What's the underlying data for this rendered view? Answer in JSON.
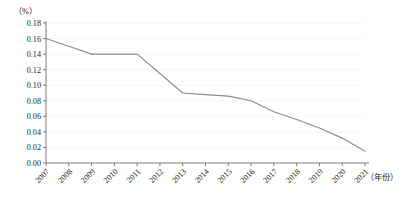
{
  "chart_data": {
    "type": "line",
    "title": "",
    "subtitle": "",
    "xlabel": "（年份）",
    "ylabel": "（%）",
    "ylim": [
      0,
      0.18
    ],
    "ytick_step": 0.02,
    "yticks": [
      "0.00",
      "0.02",
      "0.04",
      "0.06",
      "0.08",
      "0.10",
      "0.12",
      "0.14",
      "0.16",
      "0.18"
    ],
    "ytick_values": [
      0.0,
      0.02,
      0.04,
      0.06,
      0.08,
      0.1,
      0.12,
      0.14,
      0.16,
      0.18
    ],
    "categories": [
      "2007",
      "2008",
      "2009",
      "2010",
      "2011",
      "2012",
      "2013",
      "2014",
      "2015",
      "2016",
      "2017",
      "2018",
      "2019",
      "2020",
      "2021"
    ],
    "x": [
      2007,
      2008,
      2009,
      2010,
      2011,
      2012,
      2013,
      2014,
      2015,
      2016,
      2017,
      2018,
      2019,
      2020,
      2021
    ],
    "values": [
      0.16,
      0.15,
      0.14,
      0.14,
      0.14,
      0.115,
      0.09,
      0.088,
      0.086,
      0.08,
      0.066,
      0.056,
      0.045,
      0.032,
      0.015
    ],
    "series": [
      {
        "name": "",
        "color": "#8c8c8c",
        "values": [
          0.16,
          0.15,
          0.14,
          0.14,
          0.14,
          0.115,
          0.09,
          0.088,
          0.086,
          0.08,
          0.066,
          0.056,
          0.045,
          0.032,
          0.015
        ]
      }
    ],
    "grid": true,
    "grid_axis": "y",
    "grid_color": "#f0f0f0",
    "legend": false,
    "legend_position": "none",
    "markers": false,
    "annotations": []
  },
  "axis_labels": {
    "y_unit": "（%）",
    "x_unit": "（年份）"
  },
  "colors": {
    "line": "#8c8c8c",
    "axis": "#5a5a5a",
    "grid": "#f0f0f0",
    "text": "#231f20",
    "background": "#ffffff"
  }
}
